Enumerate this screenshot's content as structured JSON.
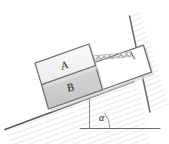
{
  "figure": {
    "kind": "physics-diagram",
    "background_color": "#ffffff"
  },
  "labels": {
    "block_top": "A",
    "block_bottom": "B",
    "angle": "α"
  },
  "colors": {
    "outline": "#4a4a4a",
    "incline_line": "#555555",
    "block_a_fill": "#f2f2f2",
    "block_b_fill": "#cfcfcf",
    "frame_fill": "#ffffff",
    "hatch": "#bdbdbd",
    "shadow": "#d8d8d8",
    "text": "#1a1a1a"
  },
  "geometry": {
    "incline_angle_deg": 20,
    "incline_start": [
      6,
      128
    ],
    "incline_end": [
      133,
      82
    ],
    "baseline_start": [
      82,
      128
    ],
    "baseline_end": [
      160,
      128
    ],
    "wall_top": [
      130,
      17
    ],
    "wall_bottom": [
      118,
      50
    ],
    "spring_turns": 16
  },
  "elements": [
    {
      "name": "inclined-plane",
      "label": ""
    },
    {
      "name": "horizontal-baseline",
      "label": ""
    },
    {
      "name": "angle-marker",
      "label": "α"
    },
    {
      "name": "block-a",
      "label": "A"
    },
    {
      "name": "block-b",
      "label": "B"
    },
    {
      "name": "spring",
      "label": ""
    },
    {
      "name": "wall",
      "label": ""
    },
    {
      "name": "frame-box",
      "label": ""
    }
  ]
}
